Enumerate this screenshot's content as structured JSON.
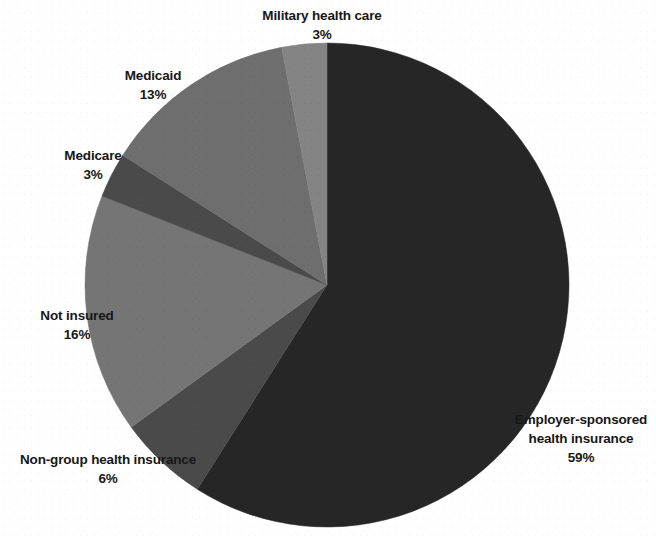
{
  "chart_data": {
    "type": "pie",
    "title": "",
    "subtitle": "",
    "xlabel": "",
    "ylabel": "",
    "legend_position": "none",
    "grid": false,
    "start_angle_deg": 0,
    "direction": "clockwise",
    "value_unit": "percent",
    "categories": [
      "Employer-sponsored health insurance",
      "Non-group health insurance",
      "Not insured",
      "Medicare",
      "Medicaid",
      "Military health care"
    ],
    "values": [
      59,
      6,
      16,
      3,
      13,
      3
    ],
    "slices": [
      {
        "label": "Employer-sponsored health insurance",
        "label_line1": "Employer-sponsored",
        "label_line2": "health insurance",
        "value": 59,
        "value_text": "59%",
        "color": "#262626"
      },
      {
        "label": "Non-group health insurance",
        "label_line1": "Non-group health insurance",
        "label_line2": "",
        "value": 6,
        "value_text": "6%",
        "color": "#4a4a4a"
      },
      {
        "label": "Not insured",
        "label_line1": "Not insured",
        "label_line2": "",
        "value": 16,
        "value_text": "16%",
        "color": "#757575"
      },
      {
        "label": "Medicare",
        "label_line1": "Medicare",
        "label_line2": "",
        "value": 3,
        "value_text": "3%",
        "color": "#4a4a4a"
      },
      {
        "label": "Medicaid",
        "label_line1": "Medicaid",
        "label_line2": "",
        "value": 13,
        "value_text": "13%",
        "color": "#6e6e6e"
      },
      {
        "label": "Military health care",
        "label_line1": "Military health care",
        "label_line2": "",
        "value": 3,
        "value_text": "3%",
        "color": "#848484"
      }
    ]
  },
  "labels": {
    "military": {
      "name": "Military health care",
      "pct": "3%"
    },
    "medicaid": {
      "name": "Medicaid",
      "pct": "13%"
    },
    "medicare": {
      "name": "Medicare",
      "pct": "3%"
    },
    "not_insured": {
      "name": "Not insured",
      "pct": "16%"
    },
    "non_group": {
      "name": "Non-group health insurance",
      "pct": "6%"
    },
    "employer": {
      "line1": "Employer-sponsored",
      "line2": "health insurance",
      "pct": "59%"
    }
  },
  "colors": {
    "background": "#ffffff",
    "text": "#171717",
    "employer": "#262626",
    "non_group": "#4a4a4a",
    "not_insured": "#757575",
    "medicare": "#4a4a4a",
    "medicaid": "#6e6e6e",
    "military": "#848484"
  }
}
